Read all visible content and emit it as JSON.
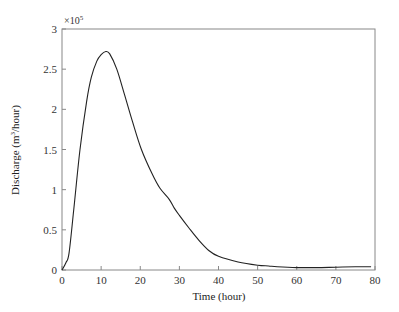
{
  "chart_data": {
    "type": "line",
    "title": "",
    "xlabel": "Time (hour)",
    "ylabel_main": "Discharge (m",
    "ylabel_sup": "3",
    "ylabel_end": "/hour)",
    "ylabel": "Discharge (m^3/hour)",
    "y_multiplier_base": "×10",
    "y_multiplier_exp": "5",
    "xlim": [
      0,
      80
    ],
    "ylim": [
      0,
      3
    ],
    "xticks": [
      0,
      10,
      20,
      30,
      40,
      50,
      60,
      70,
      80
    ],
    "yticks": [
      0,
      0.5,
      1,
      1.5,
      2,
      2.5,
      3
    ],
    "ytick_labels": [
      "0",
      "0.5",
      "1",
      "1.5",
      "2",
      "2.5",
      "3"
    ],
    "grid": false,
    "legend": null,
    "line_color": "#222222",
    "series": [
      {
        "name": "Discharge",
        "x": [
          0,
          1,
          1.8,
          3,
          4.6,
          6.3,
          7.5,
          8.9,
          10,
          11.2,
          12.2,
          14,
          16,
          18,
          20.3,
          23,
          25,
          27.4,
          28.7,
          30,
          32.5,
          35,
          37.6,
          40,
          45,
          50,
          52.8,
          55,
          60,
          65,
          70,
          75,
          79
        ],
        "y": [
          0,
          0.09,
          0.21,
          0.75,
          1.5,
          2.1,
          2.4,
          2.6,
          2.68,
          2.72,
          2.69,
          2.5,
          2.18,
          1.85,
          1.5,
          1.2,
          1.02,
          0.88,
          0.77,
          0.68,
          0.52,
          0.37,
          0.24,
          0.17,
          0.1,
          0.06,
          0.05,
          0.04,
          0.03,
          0.03,
          0.035,
          0.04,
          0.04
        ]
      }
    ]
  }
}
